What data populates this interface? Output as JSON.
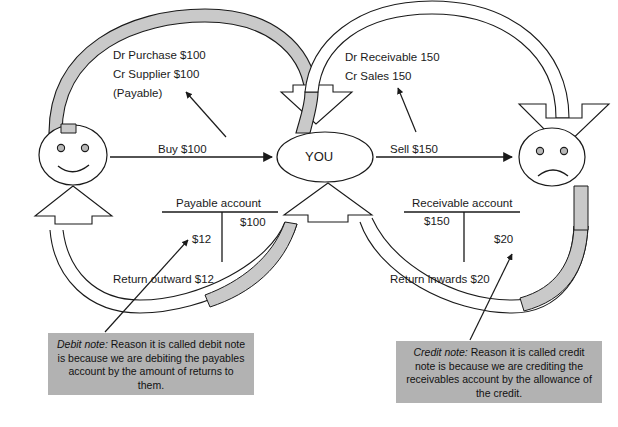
{
  "diagram": {
    "actors": {
      "supplier": {
        "name": "supplier-smiley-face",
        "mood": "happy"
      },
      "center": {
        "label": "YOU"
      },
      "customer": {
        "name": "customer-sad-face",
        "mood": "sad"
      }
    },
    "flow_arrows": {
      "buy": "Buy $100",
      "sell": "Sell $150",
      "return_outward": "Return outward $12",
      "return_inwards": "Return inwards $20"
    },
    "journal_left": {
      "line1": "Dr Purchase $100",
      "line2": "Cr Supplier $100",
      "line3": "(Payable)"
    },
    "journal_right": {
      "line1": "Dr Receivable 150",
      "line2": "Cr Sales 150"
    },
    "t_accounts": [
      {
        "name": "payable-account",
        "title": "Payable account",
        "debit": "$12",
        "credit": "$100"
      },
      {
        "name": "receivable-account",
        "title": "Receivable account",
        "debit": "$150",
        "credit": "$20"
      }
    ],
    "notes": [
      {
        "name": "debit-note",
        "title": "Debit note:",
        "body": " Reason it is called debit note is because we are debiting the payables account by the amount of returns to them."
      },
      {
        "name": "credit-note",
        "title": "Credit note:",
        "body": " Reason it is called credit note is because we are crediting the receivables account by the allowance of the credit."
      }
    ],
    "colors": {
      "band_fill": "#c9c9c9",
      "note_fill": "#b2b2b2",
      "stroke": "#1a1a1a"
    }
  }
}
